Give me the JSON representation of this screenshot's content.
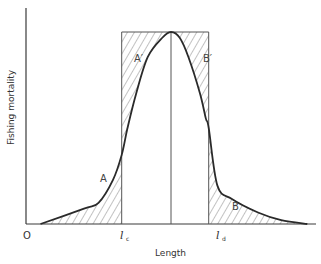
{
  "figure": {
    "type": "selection-curve-diagram",
    "ylabel": "Fishing mortality",
    "xlabel": "Length",
    "origin_label": "O",
    "ticks": [
      {
        "symbol": "l",
        "subscript": "c"
      },
      {
        "symbol": "l",
        "subscript": "d"
      }
    ],
    "regions": [
      {
        "id": "A",
        "label": "A",
        "description": "area under curve left of l_c"
      },
      {
        "id": "A_prime",
        "label": "A′",
        "description": "area above curve inside rectangle left of peak"
      },
      {
        "id": "B_prime",
        "label": "B′",
        "description": "area above curve inside rectangle right of peak"
      },
      {
        "id": "B",
        "label": "B",
        "description": "area under curve right of l_d"
      }
    ]
  },
  "chart_data": {
    "type": "line",
    "title": "",
    "xlabel": "Length",
    "ylabel": "Fishing mortality",
    "x_ticks": [
      "O",
      "l_c",
      "l_d"
    ],
    "x_range": [
      0,
      1
    ],
    "y_range": [
      0,
      1
    ],
    "grid": false,
    "series": [
      {
        "name": "selection curve",
        "x": [
          0.05,
          0.2,
          0.25,
          0.3,
          0.33,
          0.35,
          0.38,
          0.42,
          0.47,
          0.5,
          0.53,
          0.56,
          0.6,
          0.62,
          0.63,
          0.66,
          0.71,
          0.8,
          0.88,
          0.97
        ],
        "y": [
          0.0,
          0.08,
          0.11,
          0.23,
          0.36,
          0.5,
          0.68,
          0.87,
          0.97,
          1.0,
          0.97,
          0.87,
          0.68,
          0.55,
          0.5,
          0.2,
          0.13,
          0.06,
          0.02,
          0.0
        ]
      },
      {
        "name": "knife-edge rectangle",
        "x": [
          0.33,
          0.33,
          0.63,
          0.63
        ],
        "y": [
          0,
          1,
          1,
          0
        ]
      }
    ]
  }
}
